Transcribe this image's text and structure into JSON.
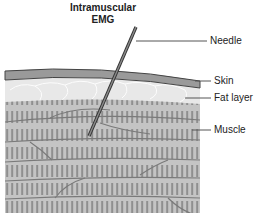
{
  "title": {
    "line1": "Intramuscular",
    "line2": "EMG"
  },
  "labels": {
    "needle": "Needle",
    "skin": "Skin",
    "fat": "Fat layer",
    "muscle": "Muscle"
  },
  "colors": {
    "skin": "#9a9a9a",
    "fat": "#e6e6e6",
    "muscle": "#bdbdbd",
    "striation": "#8f8f8f",
    "needle": "#555555",
    "outline": "#444444"
  }
}
